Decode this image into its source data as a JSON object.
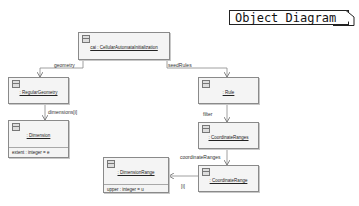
{
  "diagram": {
    "title": "Object Diagram",
    "objects": [
      {
        "id": "cai",
        "name": "cai : CellularAutomataInitialization",
        "attributes": []
      },
      {
        "id": "regular_geometry",
        "name": ": RegularGeometry",
        "attributes": []
      },
      {
        "id": "dimension",
        "name": ": Dimension",
        "attributes": [
          "extent : integer = e"
        ]
      },
      {
        "id": "rule",
        "name": ": Rule",
        "attributes": []
      },
      {
        "id": "coordinate_ranges",
        "name": ": CoordinateRanges",
        "attributes": []
      },
      {
        "id": "coordinate_range",
        "name": ": CoordinateRange",
        "attributes": []
      },
      {
        "id": "dimension_range",
        "name": ": DimensionRange",
        "attributes": [
          "upper : integer = u"
        ]
      }
    ],
    "links": [
      {
        "from": "cai",
        "to": "regular_geometry",
        "label": "geometry"
      },
      {
        "from": "cai",
        "to": "rule",
        "label": "seedRules"
      },
      {
        "from": "regular_geometry",
        "to": "dimension",
        "label": "dimensions[i]"
      },
      {
        "from": "rule",
        "to": "coordinate_ranges",
        "label": "filter"
      },
      {
        "from": "coordinate_ranges",
        "to": "coordinate_range",
        "label": "coordinateRanges"
      },
      {
        "from": "coordinate_range",
        "to": "dimension_range",
        "label": "[i]"
      }
    ]
  },
  "colors": {
    "box_fill": "#f4f4f4",
    "box_border": "#8a8a8a",
    "line": "#777777"
  }
}
